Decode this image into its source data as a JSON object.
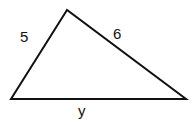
{
  "diagram": {
    "type": "triangle",
    "stroke_color": "#111111",
    "background": "#ffffff",
    "vertices": {
      "top": [
        67,
        10
      ],
      "bottom_left": [
        11,
        99
      ],
      "bottom_right": [
        186,
        99
      ]
    },
    "sides": [
      {
        "id": "left",
        "label": "5"
      },
      {
        "id": "right",
        "label": "6"
      },
      {
        "id": "bottom",
        "label": "y"
      }
    ]
  }
}
